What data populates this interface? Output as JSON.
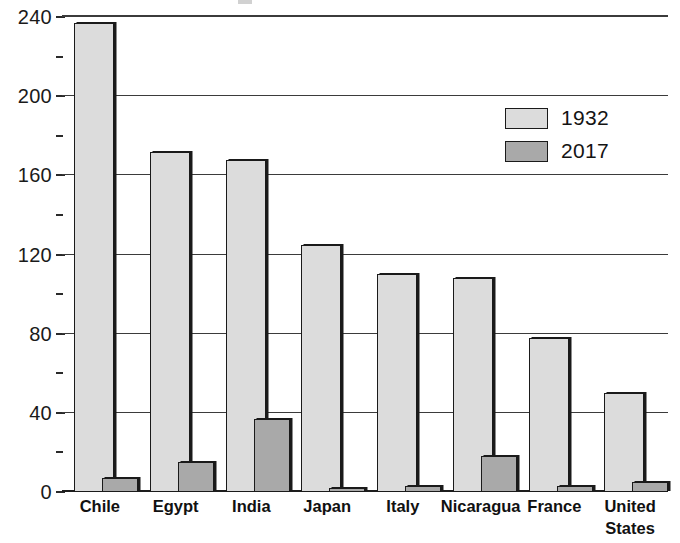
{
  "chart_data": {
    "type": "bar",
    "title": "",
    "xlabel": "",
    "ylabel": "",
    "ylim": [
      0,
      240
    ],
    "y_ticks": [
      0,
      40,
      80,
      120,
      160,
      200,
      240
    ],
    "y_minor_tick_step": 20,
    "grid": true,
    "legend_position": "upper-right",
    "categories": [
      "Chile",
      "Egypt",
      "India",
      "Japan",
      "Italy",
      "Nicaragua",
      "France",
      "United States"
    ],
    "series": [
      {
        "name": "1932",
        "color": "#dcdcdc",
        "values": [
          237,
          172,
          168,
          125,
          110,
          108,
          78,
          50
        ]
      },
      {
        "name": "2017",
        "color": "#a9a9a9",
        "values": [
          7,
          15,
          37,
          2,
          3,
          18,
          3,
          5
        ]
      }
    ]
  },
  "legend": {
    "items": [
      {
        "label": "1932",
        "color": "#dcdcdc"
      },
      {
        "label": "2017",
        "color": "#a9a9a9"
      }
    ]
  },
  "axis": {
    "y_tick_labels": [
      "240",
      "200",
      "160",
      "120",
      "80",
      "40",
      "0"
    ]
  },
  "x_axis": {
    "labels": [
      "Chile",
      "Egypt",
      "India",
      "Japan",
      "Italy",
      "Nicaragua",
      "France",
      "United States"
    ]
  }
}
